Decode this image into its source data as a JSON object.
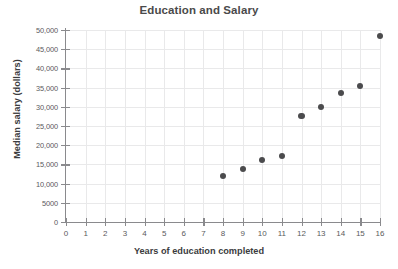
{
  "chart_data": {
    "type": "scatter",
    "title": "Education and Salary",
    "xlabel": "Years of education completed",
    "ylabel": "Median salary (dollars)",
    "xlim": [
      0,
      16
    ],
    "ylim": [
      0,
      50000
    ],
    "grid": true,
    "legend": "none",
    "marker_color": "#4b4b4d",
    "x": [
      8,
      9,
      10,
      11,
      12,
      13,
      14,
      15,
      16
    ],
    "y": [
      12000,
      13700,
      16200,
      17200,
      27500,
      30000,
      33500,
      35500,
      48500
    ],
    "points": [
      {
        "x": 8,
        "y": 12000
      },
      {
        "x": 9,
        "y": 13700
      },
      {
        "x": 10,
        "y": 16200
      },
      {
        "x": 11,
        "y": 17200
      },
      {
        "x": 12,
        "y": 27500
      },
      {
        "x": 13,
        "y": 30000
      },
      {
        "x": 14,
        "y": 33500
      },
      {
        "x": 15,
        "y": 35500
      },
      {
        "x": 16,
        "y": 48500
      }
    ],
    "xticks": [
      0,
      1,
      2,
      3,
      4,
      5,
      6,
      7,
      8,
      9,
      10,
      11,
      12,
      13,
      14,
      15,
      16
    ],
    "xtick_labels": [
      "0",
      "1",
      "2",
      "3",
      "4",
      "5",
      "6",
      "7",
      "8",
      "9",
      "10",
      "11",
      "12",
      "13",
      "14",
      "15",
      "16"
    ],
    "yticks": [
      0,
      5000,
      10000,
      15000,
      20000,
      25000,
      30000,
      35000,
      40000,
      45000,
      50000
    ],
    "ytick_labels": [
      "0",
      "5000",
      "10,000",
      "15,000",
      "20,000",
      "25,000",
      "30,000",
      "35,000",
      "40,000",
      "45,000",
      "50,000"
    ]
  },
  "colors": {
    "marker": "#4b4b4d",
    "grid": "#e9e9ea",
    "axis": "#8a8a8d",
    "title_text": "#4a4a4a",
    "label_text": "#3c3c3e",
    "tick_text": "#5a5a5c",
    "background": "#ffffff"
  }
}
